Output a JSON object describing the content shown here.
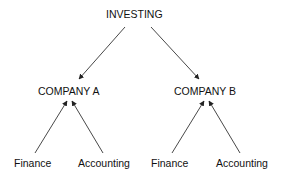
{
  "diagram": {
    "type": "hierarchy",
    "root": {
      "label": "INVESTING"
    },
    "companies": [
      {
        "label": "COMPANY A",
        "children": [
          {
            "label": "Finance"
          },
          {
            "label": "Accounting"
          }
        ]
      },
      {
        "label": "COMPANY B",
        "children": [
          {
            "label": "Finance"
          },
          {
            "label": "Accounting"
          }
        ]
      }
    ],
    "edges": [
      {
        "from": "INVESTING",
        "to": "COMPANY A"
      },
      {
        "from": "INVESTING",
        "to": "COMPANY B"
      },
      {
        "from": "Finance (A)",
        "to": "COMPANY A"
      },
      {
        "from": "Accounting (A)",
        "to": "COMPANY A"
      },
      {
        "from": "Finance (B)",
        "to": "COMPANY B"
      },
      {
        "from": "Accounting (B)",
        "to": "COMPANY B"
      }
    ],
    "colors": {
      "line": "#333333",
      "text": "#111111",
      "background": "#ffffff"
    }
  }
}
